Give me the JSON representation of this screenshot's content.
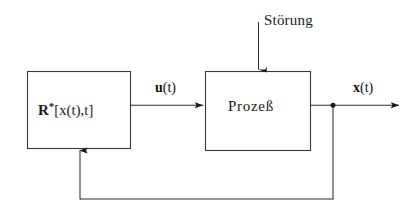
{
  "diagram": {
    "type": "control-block-diagram",
    "language": "de",
    "background_color": "#ffffff",
    "line_color": "#1a1a1a",
    "text_color": "#1a1a1a",
    "blocks": [
      {
        "id": "controller",
        "name": "controller-block",
        "label_bold": "R",
        "label_superscript": "*",
        "label_rest": "[x(t),t]",
        "label_plain": "R*[x(t),t]",
        "x": 27,
        "y": 71,
        "width": 103,
        "height": 77
      },
      {
        "id": "plant",
        "name": "plant-block",
        "label_plain": "Prozeß",
        "x": 205,
        "y": 71,
        "width": 105,
        "height": 79
      }
    ],
    "signals": [
      {
        "id": "u",
        "name": "control-signal",
        "label_vector": "u",
        "label_arg": "(t)",
        "label_plain": "u(t)",
        "from": "controller",
        "to": "plant"
      },
      {
        "id": "x",
        "name": "state-signal",
        "label_vector": "x",
        "label_arg": "(t)",
        "label_plain": "x(t)",
        "from": "plant",
        "to": "output"
      }
    ],
    "disturbance": {
      "name": "disturbance-input",
      "label_plain": "Störung",
      "enters": "plant",
      "direction": "top-down"
    },
    "feedback": {
      "name": "feedback-path",
      "from": "state-signal-junction",
      "to": "controller",
      "direction": "bottom-up"
    },
    "junction": {
      "name": "signal-junction-dot",
      "x": 333,
      "y": 105
    }
  }
}
